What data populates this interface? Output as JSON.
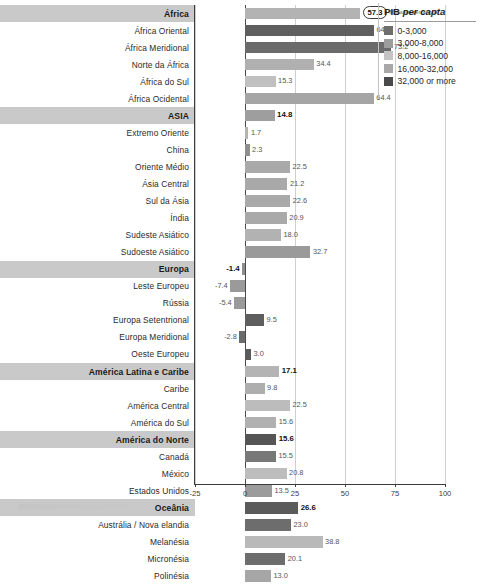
{
  "chart_data": {
    "type": "bar",
    "title": "",
    "xlabel": "",
    "ylabel": "",
    "orientation": "horizontal",
    "xlim": [
      -25,
      100
    ],
    "grid": true,
    "xticks": [
      -25,
      0,
      25,
      50,
      75,
      100
    ],
    "xtick_labels": [
      "-25",
      "0",
      "25",
      "50",
      "75",
      "100"
    ],
    "value_annotation": "Mudança percentual",
    "highlighted_category": "África",
    "legend": {
      "title_plain": "PIB ",
      "title_italic": "per capta",
      "position": "right",
      "entries": [
        {
          "label": "0-3,000",
          "color": "#6e6e6e"
        },
        {
          "label": "3,000-8,000",
          "color": "#9d9d9d"
        },
        {
          "label": "8,000-16,000",
          "color": "#c4c4c4"
        },
        {
          "label": "16,000-32,000",
          "color": "#a8a8a8"
        },
        {
          "label": "32,000 or more",
          "color": "#4a4a4a"
        }
      ]
    },
    "categories": [
      {
        "label": "África",
        "value": 57.3,
        "color": "#b3b3b3",
        "group": true,
        "bold": true
      },
      {
        "label": "África Oriental",
        "value": 64.5,
        "color": "#5f5f5f",
        "group": false,
        "bold": false
      },
      {
        "label": "África Meridional",
        "value": 73.2,
        "color": "#6b6b6b",
        "group": false,
        "bold": false
      },
      {
        "label": "Norte da África",
        "value": 34.4,
        "color": "#b0b0b0",
        "group": false,
        "bold": false
      },
      {
        "label": "África do Sul",
        "value": 15.3,
        "color": "#c0c0c0",
        "group": false,
        "bold": false
      },
      {
        "label": "África Ocidental",
        "value": 64.4,
        "color": "#a5a5a5",
        "group": false,
        "bold": false
      },
      {
        "label": "ASIA",
        "value": 14.8,
        "color": "#9e9e9e",
        "group": true,
        "bold": true
      },
      {
        "label": "Extremo Oriente",
        "value": 1.7,
        "color": "#b4b4b4",
        "group": false,
        "bold": false
      },
      {
        "label": "China",
        "value": 2.3,
        "color": "#8f8f8f",
        "group": false,
        "bold": false
      },
      {
        "label": "Oriente Médio",
        "value": 22.5,
        "color": "#a9a9a9",
        "group": false,
        "bold": false
      },
      {
        "label": "Ásia Central",
        "value": 21.2,
        "color": "#a9a9a9",
        "group": false,
        "bold": false
      },
      {
        "label": "Sul da Ásia",
        "value": 22.6,
        "color": "#a9a9a9",
        "group": false,
        "bold": false
      },
      {
        "label": "Índia",
        "value": 20.9,
        "color": "#a9a9a9",
        "group": false,
        "bold": false
      },
      {
        "label": "Sudeste Asiático",
        "value": 18.0,
        "color": "#b2b2b2",
        "group": false,
        "bold": false
      },
      {
        "label": "Sudoeste Asiático",
        "value": 32.7,
        "color": "#9a9a9a",
        "group": false,
        "bold": false
      },
      {
        "label": "Europa",
        "value": -1.4,
        "color": "#8d8d8d",
        "group": true,
        "bold": true
      },
      {
        "label": "Leste Europeu",
        "value": -7.4,
        "color": "#9a9a9a",
        "group": false,
        "bold": false
      },
      {
        "label": "Rússia",
        "value": -5.4,
        "color": "#9a9a9a",
        "group": false,
        "bold": false
      },
      {
        "label": "Europa Setentrional",
        "value": 9.5,
        "color": "#5e5e5e",
        "group": false,
        "bold": false
      },
      {
        "label": "Europa Meridional",
        "value": -2.8,
        "color": "#6b6b6b",
        "group": false,
        "bold": false
      },
      {
        "label": "Oeste Europeu",
        "value": 3.0,
        "color": "#5a5a5a",
        "group": false,
        "bold": false
      },
      {
        "label": "América Latina e Caribe",
        "value": 17.1,
        "color": "#b4b4b4",
        "group": true,
        "bold": true
      },
      {
        "label": "Caribe",
        "value": 9.8,
        "color": "#aeaeae",
        "group": false,
        "bold": false
      },
      {
        "label": "América Central",
        "value": 22.5,
        "color": "#bcbcbc",
        "group": false,
        "bold": false
      },
      {
        "label": "América do Sul",
        "value": 15.6,
        "color": "#b0b0b0",
        "group": false,
        "bold": false
      },
      {
        "label": "América do Norte",
        "value": 15.6,
        "color": "#555555",
        "group": true,
        "bold": true
      },
      {
        "label": "Canadá",
        "value": 15.5,
        "color": "#787878",
        "group": false,
        "bold": false
      },
      {
        "label": "México",
        "value": 20.8,
        "color": "#bdbdbd",
        "group": false,
        "bold": false
      },
      {
        "label": "Estados Unidos",
        "value": 13.5,
        "color": "#9b9b9b",
        "group": false,
        "bold": false
      },
      {
        "label": "Oceânia",
        "value": 26.6,
        "color": "#5b5b5b",
        "group": true,
        "bold": true
      },
      {
        "label": "Austrália / Nova elandia",
        "value": 23.0,
        "color": "#6d6d6d",
        "group": false,
        "bold": false
      },
      {
        "label": "Melanésia",
        "value": 38.8,
        "color": "#b9b9b9",
        "group": false,
        "bold": false
      },
      {
        "label": "Micronésia",
        "value": 20.1,
        "color": "#6d6d6d",
        "group": false,
        "bold": false
      },
      {
        "label": "Polinésia",
        "value": 13.0,
        "color": "#a6a6a6",
        "group": false,
        "bold": false
      }
    ]
  }
}
